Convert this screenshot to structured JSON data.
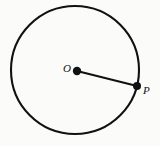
{
  "figure": {
    "type": "geometry-diagram",
    "background_color": "#fbfbfa",
    "stroke_color": "#111111",
    "canvas": {
      "width": 160,
      "height": 146
    },
    "circle": {
      "name": "circle",
      "center_x": 75,
      "center_y": 70,
      "radius": 64,
      "stroke_width": 2.1,
      "fill": "none"
    },
    "points": [
      {
        "id": "O",
        "label": "O",
        "role": "center",
        "x": 77,
        "y": 71,
        "dot_radius": 4.2,
        "label_x": 63,
        "label_y": 63
      },
      {
        "id": "P",
        "label": "P",
        "role": "on-circumference",
        "x": 137,
        "y": 86,
        "dot_radius": 4.0,
        "label_x": 143,
        "label_y": 85
      }
    ],
    "segments": [
      {
        "id": "OP",
        "name": "radius",
        "from": "O",
        "to": "P",
        "x1": 77,
        "y1": 71,
        "x2": 137,
        "y2": 86,
        "stroke_width": 2.0
      }
    ]
  }
}
